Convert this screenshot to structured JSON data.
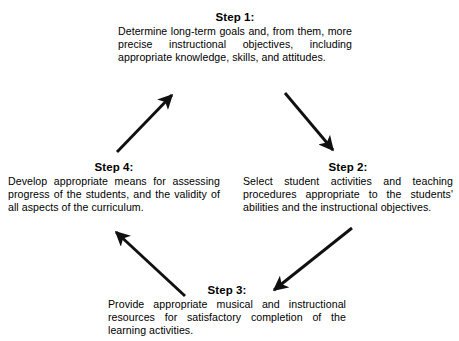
{
  "diagram": {
    "background_color": "#ffffff",
    "ink_color": "#000000",
    "steps": [
      {
        "id": "step-1",
        "title": "Step 1:",
        "body": "Determine long-term goals and, from them, more precise instructional objectives, including appropriate knowledge, skills, and attitudes."
      },
      {
        "id": "step-2",
        "title": "Step 2:",
        "body": "Select student activities and teaching procedures appropriate to the students' abilities and the instructional objectives."
      },
      {
        "id": "step-3",
        "title": "Step 3:",
        "body": "Provide appropriate musical and instructional resources for satisfactory completion of the learning activities."
      },
      {
        "id": "step-4",
        "title": "Step 4:",
        "body": "Develop appropriate means for assessing progress of the students, and the validity of all aspects of the curriculum."
      }
    ],
    "arrows": [
      {
        "id": "arrow-step1-to-step2",
        "from": "Step 1:",
        "to": "Step 2:",
        "direction": "down-right"
      },
      {
        "id": "arrow-step2-to-step3",
        "from": "Step 2:",
        "to": "Step 3:",
        "direction": "down-left"
      },
      {
        "id": "arrow-step3-to-step4",
        "from": "Step 3:",
        "to": "Step 4:",
        "direction": "up-left"
      },
      {
        "id": "arrow-step4-to-step1",
        "from": "Step 4:",
        "to": "Step 1:",
        "direction": "up-right"
      }
    ]
  }
}
